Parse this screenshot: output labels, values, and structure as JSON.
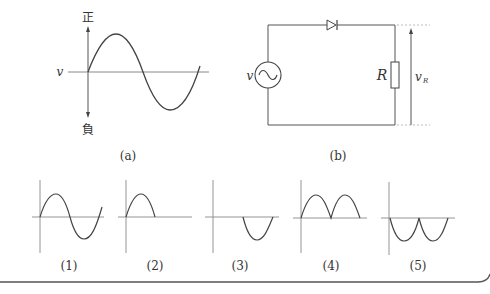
{
  "figure_a": {
    "caption": "(a)",
    "axis_top_label": "正",
    "axis_bottom_label": "負",
    "axis_left_label": "v"
  },
  "figure_b": {
    "caption": "(b)",
    "source_label": "v",
    "resistor_label": "R",
    "voltage_label_main": "v",
    "voltage_label_sub": "R"
  },
  "choices": [
    {
      "label": "(1)",
      "shape": "full-sine"
    },
    {
      "label": "(2)",
      "shape": "positive-half"
    },
    {
      "label": "(3)",
      "shape": "negative-half"
    },
    {
      "label": "(4)",
      "shape": "full-wave-positive"
    },
    {
      "label": "(5)",
      "shape": "full-wave-negative"
    }
  ],
  "colors": {
    "line": "#555555",
    "axis": "#888888",
    "text": "#333333"
  }
}
